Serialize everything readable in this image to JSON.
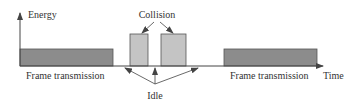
{
  "diagram": {
    "y_axis_label": "Energy",
    "x_axis_label": "Time",
    "collision_label": "Collision",
    "idle_label": "Idle",
    "frame_labels": [
      "Frame transmission",
      "Frame transmission"
    ],
    "colors": {
      "frame_fill": "#8c8c8c",
      "collision_fill": "#c4c4c4",
      "stroke": "#444444"
    }
  }
}
